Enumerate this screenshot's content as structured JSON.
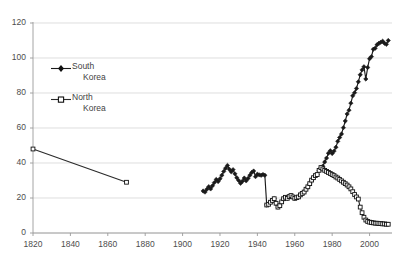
{
  "chart_data": {
    "type": "line",
    "title": "",
    "xlabel": "",
    "ylabel": "",
    "xlim": [
      1820,
      2012
    ],
    "ylim": [
      0,
      120
    ],
    "grid": true,
    "grid_axis": "y",
    "legend_position": "inside-upper-left",
    "x_ticks": [
      1820,
      1840,
      1860,
      1880,
      1900,
      1920,
      1940,
      1960,
      1980,
      2000
    ],
    "y_ticks": [
      0,
      20,
      40,
      60,
      80,
      100,
      120
    ],
    "series": [
      {
        "name": "South Korea",
        "marker": "filled-diamond",
        "color": "#1a1a1a",
        "points": [
          [
            1911,
            24.0
          ],
          [
            1912,
            23.4
          ],
          [
            1913,
            25.0
          ],
          [
            1914,
            26.5
          ],
          [
            1915,
            25.2
          ],
          [
            1916,
            27.0
          ],
          [
            1917,
            28.8
          ],
          [
            1918,
            30.6
          ],
          [
            1919,
            29.4
          ],
          [
            1920,
            31.0
          ],
          [
            1921,
            33.0
          ],
          [
            1922,
            35.2
          ],
          [
            1923,
            37.0
          ],
          [
            1924,
            38.6
          ],
          [
            1925,
            36.4
          ],
          [
            1926,
            35.0
          ],
          [
            1927,
            36.2
          ],
          [
            1928,
            33.8
          ],
          [
            1929,
            31.6
          ],
          [
            1930,
            30.0
          ],
          [
            1931,
            28.4
          ],
          [
            1932,
            29.6
          ],
          [
            1933,
            31.4
          ],
          [
            1934,
            29.8
          ],
          [
            1935,
            31.2
          ],
          [
            1936,
            33.0
          ],
          [
            1937,
            34.6
          ],
          [
            1938,
            35.4
          ],
          [
            1939,
            32.2
          ],
          [
            1940,
            33.6
          ],
          [
            1941,
            33.2
          ],
          [
            1942,
            33.0
          ],
          [
            1943,
            33.4
          ],
          [
            1944,
            33.0
          ],
          [
            1945,
            16.0
          ],
          [
            1946,
            16.4
          ],
          [
            1947,
            17.6
          ],
          [
            1948,
            18.6
          ],
          [
            1949,
            19.6
          ],
          [
            1950,
            17.0
          ],
          [
            1951,
            14.8
          ],
          [
            1952,
            15.6
          ],
          [
            1953,
            17.8
          ],
          [
            1954,
            19.6
          ],
          [
            1955,
            20.4
          ],
          [
            1956,
            19.8
          ],
          [
            1957,
            20.8
          ],
          [
            1958,
            21.4
          ],
          [
            1959,
            20.6
          ],
          [
            1960,
            19.8
          ],
          [
            1961,
            20.2
          ],
          [
            1962,
            20.6
          ],
          [
            1963,
            21.8
          ],
          [
            1964,
            22.6
          ],
          [
            1965,
            23.4
          ],
          [
            1966,
            25.0
          ],
          [
            1967,
            26.4
          ],
          [
            1968,
            28.2
          ],
          [
            1969,
            30.2
          ],
          [
            1970,
            31.6
          ],
          [
            1971,
            32.8
          ],
          [
            1972,
            33.4
          ],
          [
            1973,
            35.8
          ],
          [
            1974,
            37.4
          ],
          [
            1975,
            38.2
          ],
          [
            1976,
            40.6
          ],
          [
            1977,
            42.8
          ],
          [
            1978,
            45.6
          ],
          [
            1979,
            47.0
          ],
          [
            1980,
            45.4
          ],
          [
            1981,
            46.8
          ],
          [
            1982,
            49.0
          ],
          [
            1983,
            52.4
          ],
          [
            1984,
            54.6
          ],
          [
            1985,
            56.6
          ],
          [
            1986,
            60.2
          ],
          [
            1987,
            64.0
          ],
          [
            1988,
            68.0
          ],
          [
            1989,
            70.2
          ],
          [
            1990,
            74.2
          ],
          [
            1991,
            78.4
          ],
          [
            1992,
            80.2
          ],
          [
            1993,
            82.6
          ],
          [
            1994,
            86.4
          ],
          [
            1995,
            90.4
          ],
          [
            1996,
            93.2
          ],
          [
            1997,
            95.0
          ],
          [
            1998,
            88.0
          ],
          [
            1999,
            94.6
          ],
          [
            2000,
            99.6
          ],
          [
            2001,
            100.8
          ],
          [
            2002,
            105.0
          ],
          [
            2003,
            105.6
          ],
          [
            2004,
            107.6
          ],
          [
            2005,
            108.4
          ],
          [
            2006,
            109.0
          ],
          [
            2007,
            109.6
          ],
          [
            2008,
            108.4
          ],
          [
            2009,
            107.8
          ],
          [
            2010,
            110.0
          ]
        ]
      },
      {
        "name": "North Korea",
        "marker": "open-square",
        "color": "#2b2b2b",
        "points": [
          [
            1820,
            48.0
          ],
          [
            1870,
            29.0
          ]
        ]
      },
      {
        "name": "North Korea series",
        "marker": "open-square",
        "color": "#2b2b2b",
        "points": [
          [
            1945,
            16.0
          ],
          [
            1946,
            16.4
          ],
          [
            1947,
            17.6
          ],
          [
            1948,
            18.6
          ],
          [
            1949,
            19.6
          ],
          [
            1950,
            17.0
          ],
          [
            1951,
            14.8
          ],
          [
            1952,
            15.6
          ],
          [
            1953,
            17.8
          ],
          [
            1954,
            19.6
          ],
          [
            1955,
            20.4
          ],
          [
            1956,
            19.8
          ],
          [
            1957,
            20.8
          ],
          [
            1958,
            21.4
          ],
          [
            1959,
            20.6
          ],
          [
            1960,
            19.8
          ],
          [
            1961,
            20.2
          ],
          [
            1962,
            20.6
          ],
          [
            1963,
            21.8
          ],
          [
            1964,
            22.6
          ],
          [
            1965,
            23.4
          ],
          [
            1966,
            25.0
          ],
          [
            1967,
            26.4
          ],
          [
            1968,
            28.2
          ],
          [
            1969,
            30.2
          ],
          [
            1970,
            31.6
          ],
          [
            1971,
            32.8
          ],
          [
            1972,
            33.4
          ],
          [
            1973,
            35.8
          ],
          [
            1974,
            37.4
          ],
          [
            1975,
            36.6
          ],
          [
            1976,
            35.8
          ],
          [
            1977,
            35.2
          ],
          [
            1978,
            34.6
          ],
          [
            1979,
            34.0
          ],
          [
            1980,
            33.4
          ],
          [
            1981,
            32.8
          ],
          [
            1982,
            32.0
          ],
          [
            1983,
            31.4
          ],
          [
            1984,
            30.6
          ],
          [
            1985,
            29.8
          ],
          [
            1986,
            29.0
          ],
          [
            1987,
            28.2
          ],
          [
            1988,
            27.4
          ],
          [
            1989,
            26.4
          ],
          [
            1990,
            25.2
          ],
          [
            1991,
            23.6
          ],
          [
            1992,
            22.0
          ],
          [
            1993,
            20.6
          ],
          [
            1994,
            19.4
          ],
          [
            1995,
            14.8
          ],
          [
            1996,
            11.6
          ],
          [
            1997,
            9.0
          ],
          [
            1998,
            7.4
          ],
          [
            1999,
            6.6
          ],
          [
            2000,
            6.2
          ],
          [
            2001,
            6.0
          ],
          [
            2002,
            5.8
          ],
          [
            2003,
            5.6
          ],
          [
            2004,
            5.6
          ],
          [
            2005,
            5.4
          ],
          [
            2006,
            5.4
          ],
          [
            2007,
            5.2
          ],
          [
            2008,
            5.2
          ],
          [
            2009,
            5.0
          ],
          [
            2010,
            5.0
          ]
        ]
      }
    ],
    "legend": [
      {
        "label_line1": "South",
        "label_line2": "Korea",
        "marker": "filled-diamond"
      },
      {
        "label_line1": "North",
        "label_line2": "Korea",
        "marker": "open-square"
      }
    ]
  }
}
